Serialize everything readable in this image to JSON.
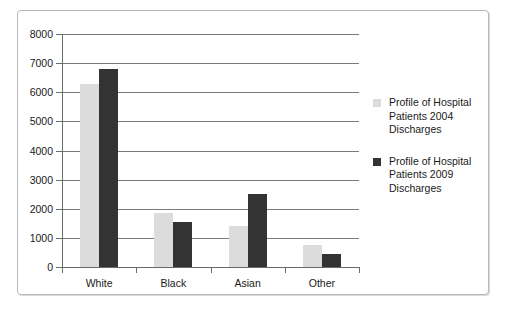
{
  "chart_data": {
    "type": "bar",
    "title": "",
    "subtitle": "",
    "xlabel": "",
    "ylabel": "",
    "categories": [
      "White",
      "Black",
      "Asian",
      "Other"
    ],
    "ylim": [
      0,
      8000
    ],
    "yticks": [
      "0",
      "1000",
      "2000",
      "3000",
      "4000",
      "5000",
      "6000",
      "7000",
      "8000"
    ],
    "ytick_values": [
      0,
      1000,
      2000,
      3000,
      4000,
      5000,
      6000,
      7000,
      8000
    ],
    "grid": true,
    "legend_position": "right",
    "series": [
      {
        "name": "Profile of Hospital Patients 2004 Discharges",
        "color": "#dcdcdc",
        "values": [
          6300,
          1850,
          1400,
          750
        ]
      },
      {
        "name": "Profile of Hospital Patients 2009 Discharges",
        "color": "#333333",
        "values": [
          6800,
          1550,
          2500,
          450
        ]
      }
    ]
  },
  "figure": {
    "border_color": "#b8b8b8",
    "background": "#ffffff",
    "axis_color": "#6a6a6a"
  }
}
